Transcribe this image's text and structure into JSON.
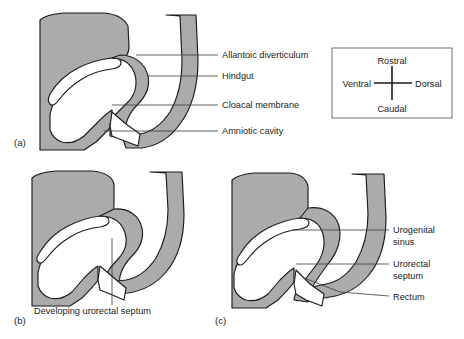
{
  "figure": {
    "background_color": "#ffffff",
    "tissue_color": "#ababab",
    "outline_color": "#1b1b1b",
    "cavity_color": "#ffffff",
    "leader_color": "#3a3a3a"
  },
  "panels": [
    {
      "id": "a",
      "letter": "(a)",
      "labels": [
        {
          "text": "Allantoic diverticulum",
          "x": 222,
          "y": 58,
          "leader_from_x": 136,
          "leader_from_y": 55,
          "leader_to_x": 218,
          "leader_to_y": 55
        },
        {
          "text": "Hindgut",
          "x": 222,
          "y": 79,
          "leader_from_x": 148,
          "leader_from_y": 76,
          "leader_to_x": 218,
          "leader_to_y": 76
        },
        {
          "text": "Cloacal membrane",
          "x": 222,
          "y": 108,
          "leader_from_x": 112,
          "leader_from_y": 105,
          "leader_to_x": 218,
          "leader_to_y": 105
        },
        {
          "text": "Amniotic cavity",
          "x": 222,
          "y": 134,
          "leader_from_x": 104,
          "leader_from_y": 131,
          "leader_to_x": 218,
          "leader_to_y": 131
        }
      ]
    },
    {
      "id": "b",
      "letter": "(b)",
      "labels": [
        {
          "text": "Developing urorectal septum",
          "x": 34,
          "y": 314,
          "leader_from_x": 112,
          "leader_from_y": 238,
          "leader_to_x": 112,
          "leader_to_y": 305
        }
      ]
    },
    {
      "id": "c",
      "letter": "(c)",
      "labels": [
        {
          "text": "Urogenital",
          "x": 393,
          "y": 233
        },
        {
          "text": "sinus",
          "x": 393,
          "y": 245
        },
        {
          "text": "Urorectal",
          "x": 393,
          "y": 267
        },
        {
          "text": "septum",
          "x": 393,
          "y": 279
        },
        {
          "text": "Rectum",
          "x": 393,
          "y": 300
        }
      ]
    }
  ],
  "compass": {
    "rostral": "Rostral",
    "ventral": "Ventral",
    "dorsal": "Dorsal",
    "caudal": "Caudal"
  }
}
